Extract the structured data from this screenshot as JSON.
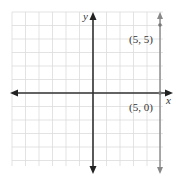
{
  "diagram": {
    "type": "coordinate-plane",
    "x_axis_label": "x",
    "y_axis_label": "y",
    "grid": {
      "x_min": -6,
      "x_max": 5,
      "y_min": -5,
      "y_max": 6,
      "cell_px": 13.5
    },
    "vertical_line": {
      "equation": "x = 5",
      "color": "#888888"
    },
    "points": [
      {
        "label": "(5, 5)",
        "x": 5,
        "y": 5
      },
      {
        "label": "(5, 0)",
        "x": 5,
        "y": 0
      }
    ],
    "colors": {
      "axis": "#333333",
      "grid": "#d8d8d8",
      "line": "#888888"
    }
  }
}
